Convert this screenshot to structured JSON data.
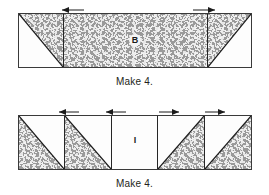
{
  "page": {
    "background_color": "#ffffff",
    "fabric_color": "#9a9a9a",
    "background_fabric_color": "#fdfdfd",
    "line_color": "#3a3a3a"
  },
  "units": [
    {
      "id": "unit-b",
      "label": "B",
      "caption": "Make 4.",
      "segments": [
        {
          "name": "left-hst",
          "fabric": "upper-right-triangle",
          "diagonal": "tl-br"
        },
        {
          "name": "center-rectangle",
          "fabric": "full"
        },
        {
          "name": "right-hst",
          "fabric": "upper-left-triangle",
          "diagonal": "bl-tr"
        }
      ],
      "press_arrows": [
        {
          "direction": "left"
        },
        {
          "direction": "right"
        }
      ]
    },
    {
      "id": "unit-i",
      "label": "I",
      "caption": "Make 4.",
      "segments": [
        {
          "name": "hst-1",
          "fabric": "lower-left-triangle",
          "diagonal": "tl-br"
        },
        {
          "name": "hst-2",
          "fabric": "lower-left-triangle",
          "diagonal": "tl-br"
        },
        {
          "name": "center-square",
          "fabric": "none"
        },
        {
          "name": "hst-3",
          "fabric": "lower-right-triangle",
          "diagonal": "bl-tr"
        },
        {
          "name": "hst-4",
          "fabric": "lower-right-triangle",
          "diagonal": "bl-tr"
        }
      ],
      "press_arrows": [
        {
          "direction": "left"
        },
        {
          "direction": "left"
        },
        {
          "direction": "right"
        },
        {
          "direction": "right"
        }
      ]
    }
  ]
}
